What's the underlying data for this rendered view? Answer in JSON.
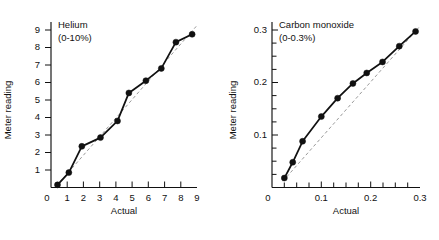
{
  "figure": {
    "panel_count": 2
  },
  "chart_data": [
    {
      "type": "line",
      "title": "Helium",
      "subtitle": "(0-10%)",
      "xlabel": "Actual",
      "ylabel": "Meter reading",
      "xlim": [
        0,
        9
      ],
      "ylim": [
        0,
        9.45
      ],
      "grid": false,
      "legend": null,
      "xticks": [
        0,
        1,
        2,
        3,
        4,
        5,
        6,
        7,
        8,
        9
      ],
      "xticklabels": [
        "0",
        "1",
        "2",
        "3",
        "4",
        "5",
        "6",
        "7",
        "8",
        "9"
      ],
      "yticks": [
        1,
        2,
        3,
        4,
        5,
        6,
        7,
        8,
        9
      ],
      "yticklabels": [
        "1",
        "2",
        "3",
        "4",
        "5",
        "6",
        "7",
        "8",
        "9"
      ],
      "series": [
        {
          "name": "Meter reading vs actual",
          "style": "solid-with-markers",
          "x": [
            0.4,
            1.1,
            1.9,
            3.05,
            4.1,
            4.8,
            5.85,
            6.8,
            7.7,
            8.7
          ],
          "y": [
            0.15,
            0.85,
            2.35,
            2.85,
            3.8,
            5.4,
            6.1,
            6.8,
            8.3,
            8.75
          ]
        },
        {
          "name": "Ideal 1:1 reference",
          "style": "dashed",
          "x": [
            0.35,
            8.95
          ],
          "y": [
            0.1,
            9.2
          ]
        }
      ]
    },
    {
      "type": "line",
      "title": "Carbon monoxide",
      "subtitle": "(0-0.3%)",
      "xlabel": "Actual",
      "ylabel": "Meter reading",
      "xlim": [
        0,
        0.3
      ],
      "ylim": [
        0,
        0.315
      ],
      "grid": false,
      "legend": null,
      "xticks": [
        0,
        0.1,
        0.2,
        0.3
      ],
      "xticklabels": [
        "0",
        "0.1",
        "0.2",
        "0.3"
      ],
      "yticks": [
        0.1,
        0.2,
        0.3
      ],
      "yticklabels": [
        "0.1",
        "0.2",
        "0.3"
      ],
      "series": [
        {
          "name": "Meter reading vs actual",
          "style": "solid-with-markers",
          "x": [
            0.025,
            0.042,
            0.062,
            0.1,
            0.133,
            0.164,
            0.192,
            0.224,
            0.258,
            0.291
          ],
          "y": [
            0.018,
            0.048,
            0.088,
            0.135,
            0.17,
            0.198,
            0.218,
            0.239,
            0.269,
            0.297
          ]
        },
        {
          "name": "Ideal 1:1 reference",
          "style": "dashed",
          "x": [
            0.022,
            0.2975
          ],
          "y": [
            0.012,
            0.3045
          ]
        }
      ]
    }
  ]
}
